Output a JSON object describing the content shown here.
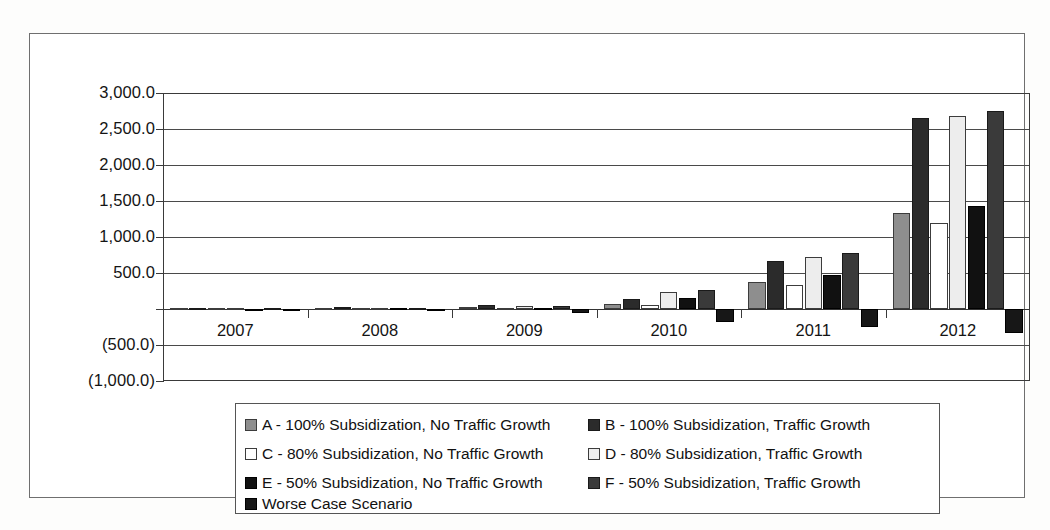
{
  "figure": {
    "background_color": "#ffffff",
    "frame_color": "#6f6f6f"
  },
  "axes": {
    "y_tick_labels": [
      "3,000.0",
      "2,500.0",
      "2,000.0",
      "1,500.0",
      "1,000.0",
      "500.0",
      "",
      "(500.0)",
      "(1,000.0)"
    ],
    "y_tick_values": [
      3000,
      2500,
      2000,
      1500,
      1000,
      500,
      0,
      -500,
      -1000
    ],
    "x_tick_labels": [
      "2007",
      "2008",
      "2009",
      "2010",
      "2011",
      "2012"
    ]
  },
  "legend": {
    "entries": [
      {
        "key": "A",
        "label": "A - 100% Subsidization, No Traffic Growth",
        "swatch": "sw-A",
        "color": "#8e8e8e"
      },
      {
        "key": "B",
        "label": "B - 100% Subsidization, Traffic Growth",
        "swatch": "sw-B",
        "color": "#2b2b2b"
      },
      {
        "key": "C",
        "label": "C - 80% Subsidization, No Traffic Growth",
        "swatch": "sw-C",
        "color": "#ffffff"
      },
      {
        "key": "D",
        "label": "D - 80% Subsidization, Traffic Growth",
        "swatch": "sw-D",
        "color": "#ededed"
      },
      {
        "key": "E",
        "label": "E - 50% Subsidization, No Traffic Growth",
        "swatch": "sw-E",
        "color": "#111111"
      },
      {
        "key": "F",
        "label": "F - 50% Subsidization, Traffic Growth",
        "swatch": "sw-F",
        "color": "#3a3a3a"
      },
      {
        "key": "W",
        "label": "Worse Case Scenario",
        "swatch": "sw-W",
        "color": "#171717"
      }
    ]
  },
  "chart_data": {
    "type": "bar",
    "title": "",
    "subtitle": "",
    "xlabel": "",
    "ylabel": "",
    "categories": [
      "2007",
      "2008",
      "2009",
      "2010",
      "2011",
      "2012"
    ],
    "ylim": [
      -1000,
      3000
    ],
    "ytick_step": 500,
    "grid": true,
    "legend_position": "bottom",
    "negative_values_in_parentheses": true,
    "series": [
      {
        "name": "A - 100% Subsidization, No Traffic Growth",
        "key": "A",
        "color": "#8e8e8e",
        "values": [
          10,
          15,
          25,
          70,
          375,
          1330
        ]
      },
      {
        "name": "B - 100% Subsidization, Traffic Growth",
        "key": "B",
        "color": "#2b2b2b",
        "values": [
          15,
          25,
          50,
          145,
          665,
          2650
        ]
      },
      {
        "name": "C - 80% Subsidization, No Traffic Growth",
        "key": "C",
        "color": "#ffffff",
        "values": [
          8,
          12,
          20,
          60,
          330,
          1200
        ]
      },
      {
        "name": "D - 80% Subsidization, Traffic Growth",
        "key": "D",
        "color": "#ededed",
        "values": [
          12,
          20,
          40,
          230,
          720,
          2680
        ]
      },
      {
        "name": "E - 50% Subsidization, No Traffic Growth",
        "key": "E",
        "color": "#111111",
        "values": [
          6,
          10,
          18,
          150,
          475,
          1430
        ]
      },
      {
        "name": "F - 50% Subsidization, Traffic Growth",
        "key": "F",
        "color": "#3a3a3a",
        "values": [
          10,
          18,
          35,
          260,
          780,
          2750
        ]
      },
      {
        "name": "Worse Case Scenario",
        "key": "W",
        "color": "#171717",
        "values": [
          -8,
          -15,
          -60,
          -185,
          -250,
          -330
        ]
      }
    ]
  }
}
